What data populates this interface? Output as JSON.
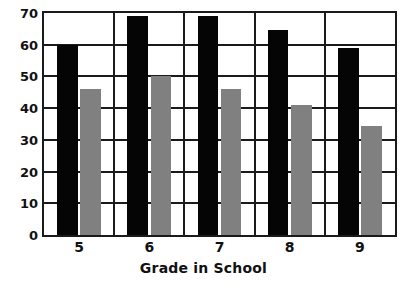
{
  "chart_data": {
    "type": "bar",
    "title": "",
    "xlabel": "Grade in School",
    "ylabel": "",
    "categories": [
      "5",
      "6",
      "7",
      "8",
      "9"
    ],
    "ylim": [
      0,
      70
    ],
    "yticks": [
      0,
      10,
      20,
      30,
      40,
      50,
      60,
      70
    ],
    "ytick_labels": [
      "0",
      "10",
      "20",
      "30",
      "40",
      "50",
      "60",
      "70"
    ],
    "grid": true,
    "legend": "none",
    "series": [
      {
        "name": "series-black",
        "color": "#050505",
        "values": [
          60,
          69,
          69,
          64.5,
          59
        ]
      },
      {
        "name": "series-grey",
        "color": "#808080",
        "values": [
          46,
          50,
          46,
          41,
          34.5
        ]
      }
    ]
  },
  "colors": {
    "axis": "#1a1a1a",
    "background": "#ffffff",
    "black_bar": "#050505",
    "grey_bar": "#808080",
    "text": "#111111"
  }
}
